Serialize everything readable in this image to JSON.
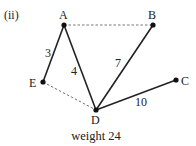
{
  "figure_label": "(ii)",
  "caption": "weight 24",
  "nodes": [
    {
      "id": "A",
      "label": "A",
      "x": 64,
      "y": 25
    },
    {
      "id": "B",
      "label": "B",
      "x": 153,
      "y": 25
    },
    {
      "id": "C",
      "label": "C",
      "x": 176,
      "y": 80
    },
    {
      "id": "D",
      "label": "D",
      "x": 96,
      "y": 110
    },
    {
      "id": "E",
      "label": "E",
      "x": 43,
      "y": 82
    }
  ],
  "edges": [
    {
      "from": "A",
      "to": "E",
      "weight": "3",
      "style": "solid"
    },
    {
      "from": "A",
      "to": "D",
      "weight": "4",
      "style": "solid"
    },
    {
      "from": "B",
      "to": "D",
      "weight": "7",
      "style": "solid"
    },
    {
      "from": "D",
      "to": "C",
      "weight": "10",
      "style": "solid"
    },
    {
      "from": "A",
      "to": "B",
      "weight": "",
      "style": "dashed"
    },
    {
      "from": "E",
      "to": "D",
      "weight": "",
      "style": "dashed"
    }
  ],
  "colors": {
    "line": "#222222",
    "dashed": "#666666"
  }
}
